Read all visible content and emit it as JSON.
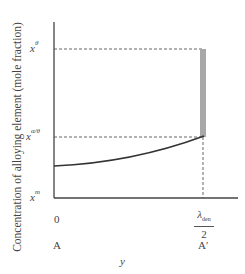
{
  "figure": {
    "y_axis_label": "Concentration of alloying element (mole fraction)",
    "x_axis_label": "y",
    "y_ticks": [
      {
        "base": "x",
        "sup": "θ"
      },
      {
        "base": "x",
        "sup": "α/θ"
      },
      {
        "base": "x",
        "sup": "m"
      }
    ],
    "x_ticks": {
      "start": "0",
      "end_numerator_base": "λ",
      "end_numerator_sub": "den",
      "end_denominator": "2"
    },
    "positions": {
      "start": "A",
      "end": "A′"
    },
    "colors": {
      "axis": "#444444",
      "curve": "#333333",
      "dashed": "#555555",
      "bar": "#a8a8a8"
    }
  }
}
